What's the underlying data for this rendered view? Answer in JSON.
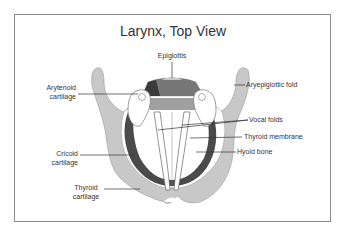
{
  "title": "Larynx, Top View",
  "labels": {
    "epiglottis": "Epiglottis",
    "arytenoid_1": "Arytenoid",
    "arytenoid_2": "cartilage",
    "aryepiglottic": "Aryepiglottic fold",
    "vocal_folds": "Vocal folds",
    "thyroid_membrane": "Thyroid membrane",
    "hyoid_bone": "Hyoid bone",
    "cricoid_1": "Cricoid",
    "cricoid_2": "cartilage",
    "thyroid_1": "Thyroid",
    "thyroid_2": "cartilage"
  },
  "colors": {
    "cartilage_gray": "#c8c8c8",
    "dark_band": "#4a4a4a",
    "epiglottis_dark": "#3a3a3a",
    "epiglottis_mid": "#777777",
    "epiglottis_light": "#a0a0a0",
    "frame_border": "#8a8a8a",
    "text": "#333333"
  }
}
